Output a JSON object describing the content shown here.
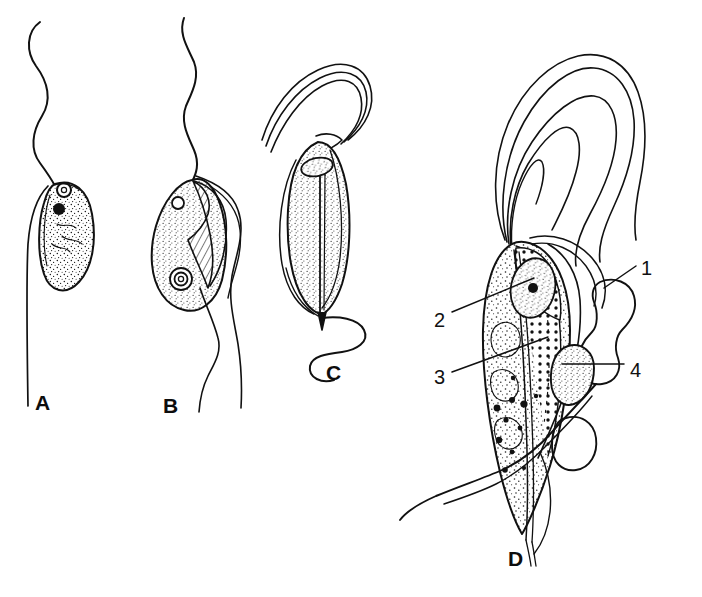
{
  "figure": {
    "type": "scientific-line-illustration",
    "background_color": "#ffffff",
    "ink_color": "#111111",
    "width": 702,
    "height": 597
  },
  "panels": [
    {
      "id": "A",
      "label": "A",
      "label_x": 35,
      "label_y": 392,
      "description": "oval stippled cell body with single anterior flagellum forming wavy S-curve and a trailing flagellum running down the left side",
      "features": [
        "anterior-flagellum",
        "kinetoplast-ring",
        "nucleus-solid-dot",
        "stippled-cytoplasm",
        "trailing-flagellum"
      ]
    },
    {
      "id": "B",
      "label": "B",
      "label_x": 163,
      "label_y": 395,
      "description": "pear-shaped stippled cell with hatched undulating membrane along right margin, small kinetoplast ring at anterior and ringed nucleus at posterior",
      "features": [
        "anterior-flagellum",
        "undulating-membrane-hatched",
        "kinetoplast-ring",
        "nucleus-ring",
        "stippled-cytoplasm",
        "free-flagellum"
      ]
    },
    {
      "id": "C",
      "label": "C",
      "label_x": 326,
      "label_y": 362,
      "description": "elongate spindle-shaped stippled cell with central axostyle, anterior nucleus blob, anterior flagellar bundle arching over the top and a long wavy posterior flagellum",
      "features": [
        "anterior-flagella-bundle",
        "nucleus",
        "axostyle",
        "stippled-cytoplasm",
        "posterior-wavy-flagellum"
      ]
    },
    {
      "id": "D",
      "label": "D",
      "label_x": 508,
      "label_y": 548,
      "description": "large elongate stippled cell with several long anterior flagella arching over the top, dotted costa, nucleus with endosome, undulating membrane and lobed vesicles on the right; four numbered structures",
      "features": [
        "anterior-flagella",
        "nucleus-with-endosome",
        "dotted-costa",
        "axostyle",
        "undulating-membrane",
        "lobed-vesicles",
        "trailing-flagellum"
      ]
    }
  ],
  "callouts": [
    {
      "number": "1",
      "label_x": 641,
      "label_y": 258,
      "leader": "short diagonal line running down-left from the numeral to the upper lobed vesicle",
      "points_to": "lobed-vesicle-upper"
    },
    {
      "number": "2",
      "label_x": 434,
      "label_y": 310,
      "leader": "long straight line running up-right from the numeral to the nucleus",
      "points_to": "nucleus"
    },
    {
      "number": "3",
      "label_x": 434,
      "label_y": 367,
      "leader": "long straight line running up-right from the numeral into the cytoplasm",
      "points_to": "cytoplasm-axostyle"
    },
    {
      "number": "4",
      "label_x": 630,
      "label_y": 360,
      "leader": "horizontal line running left from the numeral to the undulating membrane margin",
      "points_to": "undulating-membrane"
    }
  ]
}
